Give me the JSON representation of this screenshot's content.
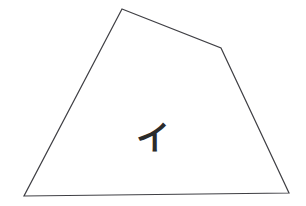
{
  "canvas": {
    "width": 306,
    "height": 206,
    "background_color": "#ffffff"
  },
  "figure": {
    "name": "irregular-pentagon-outline",
    "stroke_color": "#3f3f44",
    "stroke_width": 1.2,
    "fill_color": "none",
    "vertices": [
      {
        "label": "top",
        "x": 122,
        "y": 9
      },
      {
        "label": "upper-right",
        "x": 221,
        "y": 48
      },
      {
        "label": "bottom-right",
        "x": 289,
        "y": 193
      },
      {
        "label": "bottom-left",
        "x": 24,
        "y": 196
      }
    ],
    "points_attr": "122,9 221,48 289,193 24,196"
  },
  "annotation": {
    "name": "katakana-i-glyph",
    "character": "イ",
    "romaji": "i",
    "script": "katakana",
    "color": "#2b2b2b",
    "position": {
      "x": 139,
      "y": 124,
      "width": 21,
      "height": 28
    }
  }
}
